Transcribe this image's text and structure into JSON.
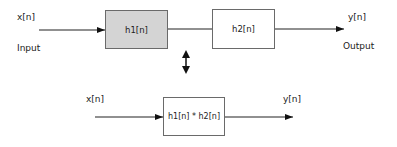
{
  "top_system": {
    "input_signal": "x[n]",
    "input_caption": "Input",
    "block1": {
      "label": "h1[n]",
      "fill": "#d4d4d4"
    },
    "block2": {
      "label": "h2[n]",
      "fill": "#ffffff"
    },
    "output_signal": "y[n]",
    "output_caption": "Output"
  },
  "equivalence_arrow": "bidirectional-arrow",
  "bottom_system": {
    "input_signal": "x[n]",
    "block": {
      "label": "h1[n] * h2[n]",
      "fill": "#ffffff"
    },
    "output_signal": "y[n]"
  }
}
